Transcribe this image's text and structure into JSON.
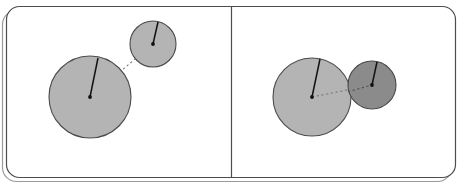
{
  "figure": {
    "title": "Two-panel circle separation diagram",
    "width": 462,
    "height": 190,
    "background_color": "#ffffff"
  },
  "frame": {
    "outer_border_color": "#9a9a9a",
    "inner_border_color": "#4d4d4d",
    "divider_color": "#4d4d4d",
    "corner_radius": 14,
    "inner": {
      "x": 6,
      "y": 6,
      "width": 450,
      "height": 172
    },
    "outer": {
      "x": 2,
      "y": 10,
      "width": 450,
      "height": 172
    },
    "divider": {
      "x": 231,
      "y1": 6,
      "y2": 178
    }
  },
  "palette": {
    "circle_light_fill": "#b4b4b4",
    "circle_dark_fill": "#8b8b8b",
    "circle_stroke": "#4a4a4a",
    "radius_line_color": "#111111",
    "center_dot_color": "#111111",
    "dashed_link_color": "#7a7a7a"
  },
  "panels": [
    {
      "id": "panel-left",
      "label": "separated",
      "circles": [
        {
          "id": "left-big-circle",
          "cx": 90,
          "cy": 97,
          "r": 41,
          "fill": "#b4b4b4",
          "radius_endpoint": {
            "x": 98,
            "y": 58
          }
        },
        {
          "id": "left-small-circle",
          "cx": 153,
          "cy": 44,
          "r": 23,
          "fill": "#b4b4b4",
          "radius_endpoint": {
            "x": 158,
            "y": 22
          }
        }
      ],
      "link": {
        "x1": 90,
        "y1": 97,
        "x2": 153,
        "y2": 44,
        "style": "dashed"
      }
    },
    {
      "id": "panel-right",
      "label": "overlapping",
      "circles": [
        {
          "id": "right-big-circle",
          "cx": 312,
          "cy": 97,
          "r": 39,
          "fill": "#b4b4b4",
          "radius_endpoint": {
            "x": 320,
            "y": 59
          }
        },
        {
          "id": "right-small-circle",
          "cx": 372,
          "cy": 85,
          "r": 24,
          "fill": "#8b8b8b",
          "radius_endpoint": {
            "x": 377,
            "y": 62
          }
        }
      ],
      "link": {
        "x1": 312,
        "y1": 97,
        "x2": 372,
        "y2": 85,
        "style": "dashed"
      }
    }
  ]
}
